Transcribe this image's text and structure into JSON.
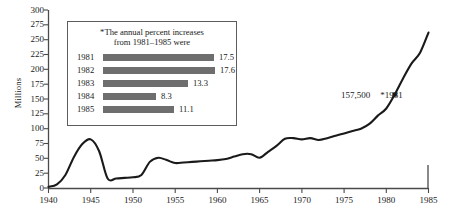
{
  "chart_data": {
    "type": "line",
    "title": "",
    "xlabel": "",
    "ylabel": "Millions",
    "xlim": [
      1940,
      1985
    ],
    "ylim": [
      0,
      300
    ],
    "grid": false,
    "legend": "none",
    "x_ticks": [
      "1940",
      "1945",
      "1950",
      "1955",
      "1960",
      "1965",
      "1970",
      "1975",
      "1980",
      "1985"
    ],
    "y_ticks": [
      "0",
      "25",
      "50",
      "75",
      "100",
      "125",
      "150",
      "175",
      "200",
      "225",
      "250",
      "275",
      "300"
    ],
    "series": [
      {
        "name": "Millions",
        "x": [
          1940,
          1941,
          1942,
          1943,
          1944,
          1945,
          1946,
          1947,
          1948,
          1949,
          1950,
          1951,
          1952,
          1953,
          1954,
          1955,
          1956,
          1957,
          1958,
          1959,
          1960,
          1961,
          1962,
          1963,
          1964,
          1965,
          1966,
          1967,
          1968,
          1969,
          1970,
          1971,
          1972,
          1973,
          1974,
          1975,
          1976,
          1977,
          1978,
          1979,
          1980,
          1981,
          1982,
          1983,
          1984,
          1985
        ],
        "values": [
          2,
          6,
          22,
          52,
          74,
          82,
          62,
          16,
          16,
          17,
          18,
          22,
          44,
          51,
          47,
          42,
          43,
          44,
          45,
          46,
          47,
          49,
          53,
          57,
          57,
          51,
          61,
          71,
          83,
          84,
          82,
          84,
          81,
          84,
          88,
          92,
          96,
          100,
          108,
          122,
          134,
          157.5,
          185,
          210,
          228,
          262
        ]
      }
    ],
    "annotations": [
      {
        "name": "marker-1981",
        "x": 1981,
        "y": 157.5,
        "value_label": "157,500",
        "note_label": "*1981"
      }
    ],
    "inset": {
      "title": "*The annual percent increases\nfrom 1981–1985 were",
      "type": "bar",
      "orientation": "horizontal",
      "categories": [
        "1981",
        "1982",
        "1983",
        "1984",
        "1985"
      ],
      "values": [
        17.5,
        17.6,
        13.3,
        8.3,
        11.1
      ],
      "value_labels": [
        "17.5",
        "17.6",
        "13.3",
        "8.3",
        "11.1"
      ],
      "bar_color": "#6e6e6e",
      "max_value": 17.6
    },
    "colors": {
      "line": "#1a1a1a",
      "axis": "#4a4a4a",
      "bar": "#6e6e6e",
      "background": "#ffffff"
    }
  }
}
